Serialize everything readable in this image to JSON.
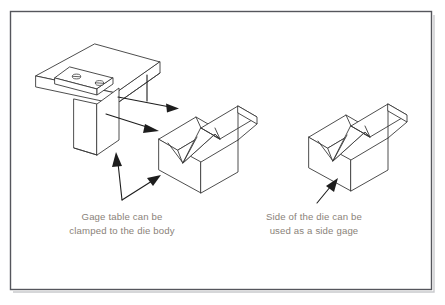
{
  "figure": {
    "background_color": "#ffffff",
    "line_color": "#3a3a3a",
    "text_color": "#8a8279",
    "frame_color": "#55565c"
  },
  "captions": {
    "left": {
      "line1": "Gage table can be",
      "line2": "clamped to the die body"
    },
    "right": {
      "line1": "Side of the die can be",
      "line2": "used as a side gage"
    }
  },
  "parts": {
    "gage_table": {
      "name": "Gage table",
      "features": [
        "top plate",
        "mounting pad",
        "two slotted screws",
        "vertical leg"
      ]
    },
    "die_left": {
      "name": "Die body with V-groove"
    },
    "die_right": {
      "name": "Die body with V-groove"
    }
  },
  "annotations": {
    "assembly_arrow_upper": "gage table mounts against die",
    "assembly_arrow_lower": "gage table leg contacts die side",
    "leader_to_leg": "points to gage table leg",
    "leader_to_die": "points to die body side",
    "leader_right": "points to side of the die"
  }
}
